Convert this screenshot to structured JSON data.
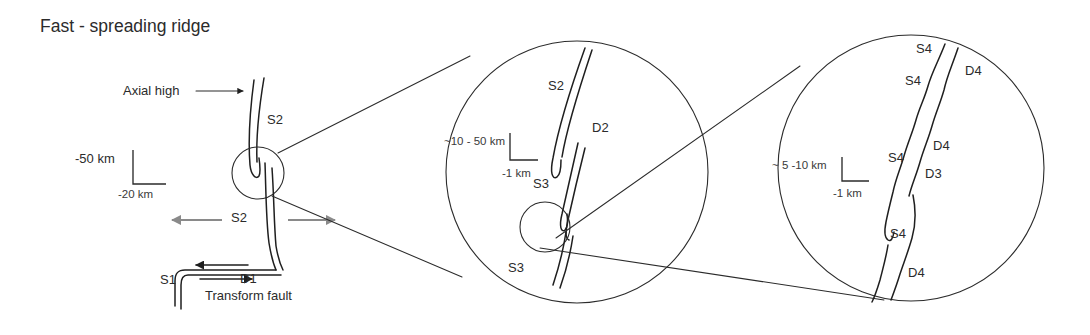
{
  "figure": {
    "title": "Fast - spreading ridge",
    "background_color": "#ffffff",
    "line_color": "#1f1f1f",
    "accent_gray": "#8a8a8a"
  },
  "panel_main": {
    "axial_high_label": "Axial high",
    "segment_s2_upper": "S2",
    "segment_s2_lower": "S2",
    "segment_s1": "S1",
    "discontinuity_d1": "D1",
    "transform_fault_label": "Transform fault",
    "scale": {
      "vertical": "-50 km",
      "horizontal": "-20 km"
    }
  },
  "panel_middle": {
    "segment_s2": "S2",
    "discontinuity_d2": "D2",
    "segment_s3_upper": "S3",
    "segment_s3_lower": "S3",
    "scale": {
      "vertical": "~10 - 50 km",
      "horizontal": "-1 km"
    }
  },
  "panel_right": {
    "segment_s4_a": "S4",
    "segment_s4_b": "S4",
    "segment_s4_c": "S4",
    "segment_s4_d": "S4",
    "discontinuity_d4_a": "D4",
    "discontinuity_d4_b": "D4",
    "discontinuity_d4_c": "D4",
    "discontinuity_d3": "D3",
    "scale": {
      "vertical": "~ 5 -10 km",
      "horizontal": "-1 km"
    }
  }
}
